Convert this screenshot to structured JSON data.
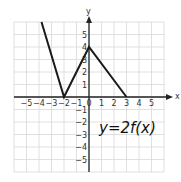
{
  "chart_data": {
    "type": "line",
    "title": "",
    "annotation": "y=2f(x)",
    "xlabel": "x",
    "ylabel": "y",
    "xlim": [
      -6,
      6
    ],
    "ylim": [
      -6,
      6
    ],
    "grid": true,
    "x_ticks": [
      -5,
      -4,
      -3,
      -2,
      -1,
      0,
      1,
      2,
      3,
      4,
      5
    ],
    "y_ticks": [
      -5,
      -4,
      -3,
      -2,
      -1,
      1,
      2,
      3,
      4,
      5
    ],
    "series": [
      {
        "name": "y=2f(x)",
        "points": [
          [
            -3.8,
            6
          ],
          [
            -2,
            0
          ],
          [
            0,
            4
          ],
          [
            3,
            0
          ]
        ]
      }
    ]
  },
  "colors": {
    "grid": "#d8d8d8",
    "axis": "#222222",
    "line": "#1a1a1a"
  }
}
